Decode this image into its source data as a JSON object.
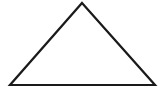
{
  "canvas": {
    "width": 164,
    "height": 92,
    "background_color": "#ffffff",
    "description": "Line drawing of a single unfilled triangle"
  },
  "figure": {
    "name": "triangle",
    "type": "polygon",
    "fill": "none",
    "fill_color": "none",
    "stroke_color": "#1a1a1a",
    "stroke_width": 2.2,
    "closed": true,
    "sides": 3,
    "classification": "isosceles-triangle",
    "orientation": "apex-up",
    "vertices": [
      {
        "name": "apex",
        "x": 82,
        "y": 3
      },
      {
        "name": "bottom-right",
        "x": 155,
        "y": 85
      },
      {
        "name": "bottom-left",
        "x": 10,
        "y": 85
      }
    ],
    "points_attr": "82,3 155,85 10,85",
    "edges": [
      {
        "name": "left-edge",
        "from": "bottom-left",
        "to": "apex"
      },
      {
        "name": "right-edge",
        "from": "apex",
        "to": "bottom-right"
      },
      {
        "name": "base-edge",
        "from": "bottom-right",
        "to": "bottom-left"
      }
    ],
    "base_width": 145,
    "height": 82
  }
}
